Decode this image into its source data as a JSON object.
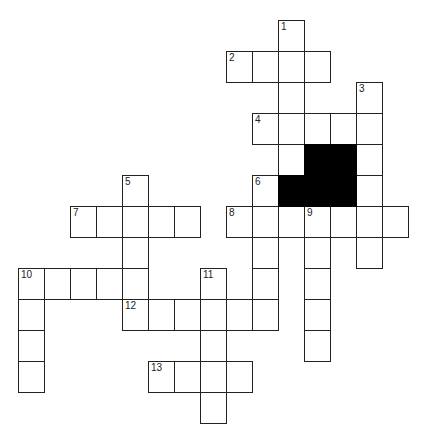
{
  "puzzle": {
    "origin": {
      "x": 18,
      "y": 20
    },
    "cell_w": 26,
    "cell_h": 31,
    "colors": {
      "border": "#222222",
      "block": "#000000",
      "background": "#ffffff"
    },
    "entries": [
      {
        "number": "1",
        "direction": "down",
        "col": 10,
        "row": 0,
        "length": 5
      },
      {
        "number": "2",
        "direction": "across",
        "col": 8,
        "row": 1,
        "length": 4
      },
      {
        "number": "3",
        "direction": "down",
        "col": 13,
        "row": 2,
        "length": 6
      },
      {
        "number": "4",
        "direction": "across",
        "col": 9,
        "row": 3,
        "length": 5
      },
      {
        "number": "5",
        "direction": "down",
        "col": 4,
        "row": 5,
        "length": 4
      },
      {
        "number": "6",
        "direction": "down",
        "col": 9,
        "row": 5,
        "length": 5
      },
      {
        "number": "7",
        "direction": "across",
        "col": 2,
        "row": 6,
        "length": 5
      },
      {
        "number": "8",
        "direction": "across",
        "col": 8,
        "row": 6,
        "length": 7
      },
      {
        "number": "9",
        "direction": "down",
        "col": 11,
        "row": 6,
        "length": 5
      },
      {
        "number": "10",
        "direction": "across",
        "col": 0,
        "row": 8,
        "length": 5
      },
      {
        "number": "10",
        "direction": "down",
        "col": 0,
        "row": 8,
        "length": 4
      },
      {
        "number": "11",
        "direction": "down",
        "col": 7,
        "row": 8,
        "length": 5
      },
      {
        "number": "12",
        "direction": "across",
        "col": 4,
        "row": 9,
        "length": 6
      },
      {
        "number": "13",
        "direction": "across",
        "col": 5,
        "row": 11,
        "length": 4
      }
    ],
    "blocks": [
      {
        "col": 11,
        "row": 4
      },
      {
        "col": 12,
        "row": 4
      },
      {
        "col": 10,
        "row": 5
      },
      {
        "col": 11,
        "row": 5
      },
      {
        "col": 12,
        "row": 5
      }
    ]
  }
}
